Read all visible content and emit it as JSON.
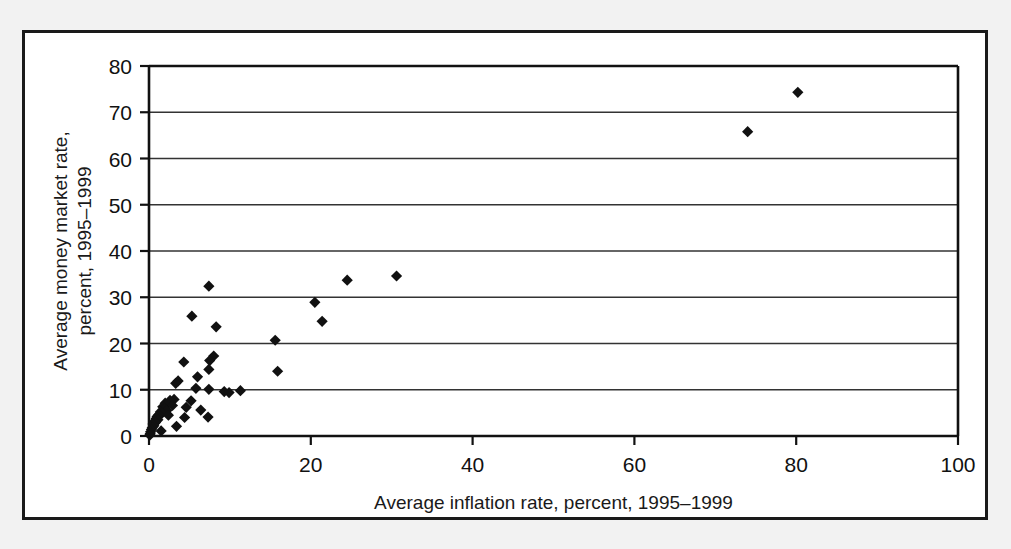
{
  "chart_data": {
    "type": "scatter",
    "title": "",
    "xlabel": "Average inflation rate, percent, 1995–1999",
    "ylabel_line1": "Average money market rate,",
    "ylabel_line2": "percent, 1995–1999",
    "ylabel": "Average money market rate, percent, 1995–1999",
    "xlim": [
      0,
      100
    ],
    "ylim": [
      0,
      80
    ],
    "xticks": [
      0,
      20,
      40,
      60,
      80,
      100
    ],
    "yticks": [
      0,
      10,
      20,
      30,
      40,
      50,
      60,
      70,
      80
    ],
    "xtick_labels": [
      "0",
      "20",
      "40",
      "60",
      "80",
      "100"
    ],
    "ytick_labels": [
      "0",
      "10",
      "20",
      "30",
      "40",
      "50",
      "60",
      "70",
      "80"
    ],
    "grid": "horizontal",
    "legend": "none",
    "marker": "diamond",
    "marker_color": "#111111",
    "points": [
      [
        80.2,
        74.3
      ],
      [
        74.0,
        65.8
      ],
      [
        30.6,
        34.6
      ],
      [
        24.5,
        33.7
      ],
      [
        7.4,
        32.4
      ],
      [
        20.5,
        28.9
      ],
      [
        5.3,
        25.9
      ],
      [
        21.4,
        24.8
      ],
      [
        8.3,
        23.6
      ],
      [
        15.6,
        20.7
      ],
      [
        8.0,
        17.3
      ],
      [
        4.3,
        16.0
      ],
      [
        7.5,
        16.3
      ],
      [
        7.4,
        14.4
      ],
      [
        15.9,
        14.0
      ],
      [
        6.0,
        12.8
      ],
      [
        3.6,
        11.9
      ],
      [
        3.3,
        11.4
      ],
      [
        5.8,
        10.3
      ],
      [
        7.4,
        10.1
      ],
      [
        11.3,
        9.8
      ],
      [
        9.3,
        9.6
      ],
      [
        9.9,
        9.4
      ],
      [
        3.1,
        7.9
      ],
      [
        2.6,
        7.7
      ],
      [
        5.2,
        7.6
      ],
      [
        2.0,
        7.1
      ],
      [
        2.3,
        6.9
      ],
      [
        2.9,
        6.6
      ],
      [
        4.6,
        6.2
      ],
      [
        6.4,
        5.6
      ],
      [
        1.7,
        6.3
      ],
      [
        1.9,
        5.9
      ],
      [
        2.2,
        5.5
      ],
      [
        1.4,
        5.2
      ],
      [
        1.6,
        4.9
      ],
      [
        1.2,
        4.6
      ],
      [
        1.0,
        4.2
      ],
      [
        2.4,
        4.5
      ],
      [
        4.4,
        4.0
      ],
      [
        7.3,
        4.1
      ],
      [
        0.9,
        3.8
      ],
      [
        1.1,
        3.5
      ],
      [
        0.7,
        3.2
      ],
      [
        0.8,
        2.9
      ],
      [
        0.5,
        2.6
      ],
      [
        0.6,
        2.2
      ],
      [
        3.4,
        2.1
      ],
      [
        0.4,
        1.8
      ],
      [
        0.3,
        1.4
      ],
      [
        1.5,
        1.1
      ],
      [
        0.2,
        0.9
      ],
      [
        0.15,
        0.5
      ],
      [
        0.1,
        0.2
      ]
    ]
  }
}
